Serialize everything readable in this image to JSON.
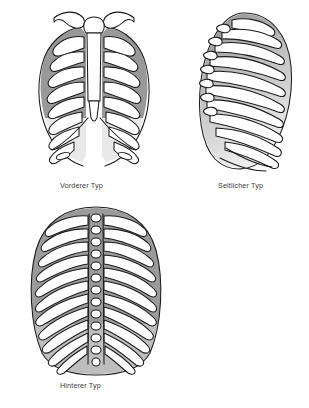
{
  "page": {
    "background_color": "#ffffff",
    "width": 309,
    "height": 408
  },
  "palette": {
    "outline": "#1a1a1a",
    "bone_fill": "#ffffff",
    "shadow_gray_dark": "#8f8f8f",
    "shadow_gray_mid": "#a8a8a8",
    "shadow_gray_light": "#cfcfcf",
    "shadow_gray_faint": "#e6e6e6",
    "caption_text": "#3a3a3a"
  },
  "figures": [
    {
      "id": "anterior",
      "caption": "Vorderer Typ",
      "view": "anterior",
      "structures": [
        "clavicle-left",
        "clavicle-right",
        "manubrium",
        "sternum-body",
        "xiphoid-process",
        "ribs",
        "costal-arch"
      ],
      "rib_pairs": 12,
      "shaded_rib_pairs": 6
    },
    {
      "id": "lateral",
      "caption": "Seitlicher Typ",
      "view": "lateral",
      "structures": [
        "ribs",
        "costal-arch"
      ],
      "rib_pairs": 12,
      "shaded_rib_pairs": 12
    },
    {
      "id": "posterior",
      "caption": "Hinterer Typ",
      "view": "posterior",
      "structures": [
        "vertebral-column",
        "spinous-processes",
        "ribs"
      ],
      "rib_pairs": 12,
      "shaded_rib_pairs": 11
    }
  ]
}
